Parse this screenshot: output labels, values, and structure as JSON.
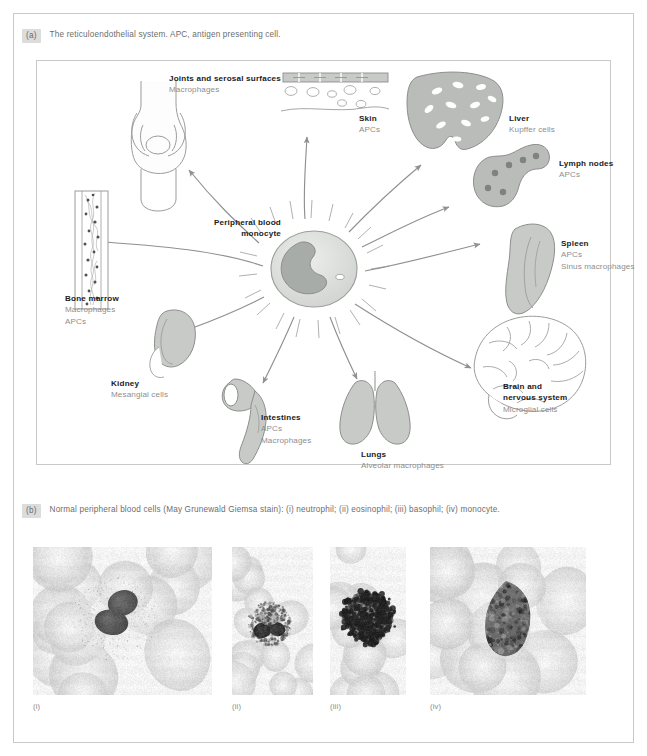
{
  "figure": {
    "panel_a": {
      "badge": "(a)",
      "caption": "The reticuloendothelial system. APC, antigen presenting cell."
    },
    "panel_b": {
      "badge": "(b)",
      "caption": "Normal peripheral blood cells (May Grunewald Giemsa stain): (i) neutrophil; (ii) eosinophil; (iii) basophil; (iv) monocyte."
    }
  },
  "diagram": {
    "center": {
      "line1": "Peripheral blood",
      "line2": "monocyte"
    },
    "nodes": [
      {
        "id": "joints",
        "title": "Joints and serosal surfaces",
        "subtitles": [
          "Macrophages"
        ]
      },
      {
        "id": "skin",
        "title": "Skin",
        "subtitles": [
          "APCs"
        ]
      },
      {
        "id": "liver",
        "title": "Liver",
        "subtitles": [
          "Kupffer cells"
        ]
      },
      {
        "id": "lymph-nodes",
        "title": "Lymph nodes",
        "subtitles": [
          "APCs"
        ]
      },
      {
        "id": "spleen",
        "title": "Spleen",
        "subtitles": [
          "APCs",
          "Sinus macrophages"
        ]
      },
      {
        "id": "brain",
        "title": "Brain and\nnervous system",
        "title_line1": "Brain and",
        "title_line2": "nervous system",
        "subtitles": [
          "Microglial cells"
        ]
      },
      {
        "id": "lungs",
        "title": "Lungs",
        "subtitles": [
          "Alveolar macrophages"
        ]
      },
      {
        "id": "intestines",
        "title": "Intestines",
        "subtitles": [
          "APCs",
          "Macrophages"
        ]
      },
      {
        "id": "kidney",
        "title": "Kidney",
        "subtitles": [
          "Mesangial cells"
        ]
      },
      {
        "id": "bone-marrow",
        "title": "Bone marrow",
        "subtitles": [
          "Macrophages",
          "APCs"
        ]
      }
    ]
  },
  "micrographs": [
    {
      "id": "neutrophil",
      "label": "(i)",
      "cell": "neutrophil"
    },
    {
      "id": "eosinophil",
      "label": "(ii)",
      "cell": "eosinophil"
    },
    {
      "id": "basophil",
      "label": "(iii)",
      "cell": "basophil"
    },
    {
      "id": "monocyte",
      "label": "(iv)",
      "cell": "monocyte"
    }
  ],
  "colors": {
    "frame": "#c9c9c9",
    "organ_fill": "#b9bcb8",
    "organ_stroke": "#8c8f8c",
    "arrow": "#8e918d",
    "title_text": "#1b1b1b",
    "subtitle_text": "#8e8e8e",
    "caption_text": "#6d6d6d",
    "badge_bg": "#dcdcdc"
  }
}
